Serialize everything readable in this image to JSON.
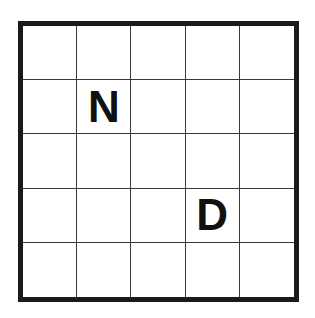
{
  "board": {
    "rows": 5,
    "cols": 5,
    "cells": [
      [
        "",
        "",
        "",
        "",
        ""
      ],
      [
        "",
        "N",
        "",
        "",
        ""
      ],
      [
        "",
        "",
        "",
        "",
        ""
      ],
      [
        "",
        "",
        "",
        "D",
        ""
      ],
      [
        "",
        "",
        "",
        "",
        ""
      ]
    ]
  },
  "colors": {
    "border": "#1a1a1a",
    "grid_line": "#3a3a3a",
    "letter": "#111111",
    "background": "#ffffff"
  }
}
